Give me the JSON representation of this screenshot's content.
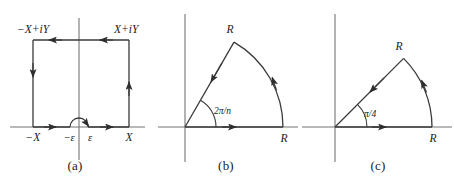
{
  "figure": {
    "type": "contour-integration-diagrams",
    "panel_count": 3,
    "stroke_color": "#3a3a3a",
    "axis_color": "#6f6f6f",
    "text_color": "#1a1a1a",
    "background": "#ffffff"
  },
  "panels": [
    {
      "id": "a",
      "caption": "(a)",
      "shape": "indented-rectangle-contour",
      "labels": {
        "top_left": "−X+iY",
        "top_right": "X+iY",
        "axis_left": "−X",
        "axis_minus_eps": "−ε",
        "axis_plus_eps": "ε",
        "axis_right": "X"
      },
      "arrows": [
        {
          "name": "bottom-left-segment",
          "direction": "right"
        },
        {
          "name": "bottom-right-segment",
          "direction": "right"
        },
        {
          "name": "right-side",
          "direction": "up"
        },
        {
          "name": "top-right-segment",
          "direction": "left"
        },
        {
          "name": "top-left-segment",
          "direction": "left"
        },
        {
          "name": "left-side",
          "direction": "down"
        },
        {
          "name": "small-semicircle-at-origin",
          "direction": "counterclockwise-over-origin"
        }
      ]
    },
    {
      "id": "b",
      "caption": "(b)",
      "shape": "circular-sector-contour",
      "labels": {
        "angle": "2π/n",
        "radius_on_ray": "R",
        "radius_on_axis": "R"
      },
      "angle_value": "2π/n",
      "arrows": [
        {
          "name": "along-real-axis",
          "direction": "right"
        },
        {
          "name": "along-arc",
          "direction": "counterclockwise"
        },
        {
          "name": "along-slanted-ray",
          "direction": "toward-origin"
        }
      ]
    },
    {
      "id": "c",
      "caption": "(c)",
      "shape": "circular-sector-contour",
      "labels": {
        "angle": "π/4",
        "radius_on_ray": "R",
        "radius_on_axis": "R"
      },
      "angle_value": "π/4",
      "arrows": [
        {
          "name": "along-real-axis",
          "direction": "right"
        },
        {
          "name": "along-arc",
          "direction": "counterclockwise"
        },
        {
          "name": "along-slanted-ray",
          "direction": "toward-origin"
        }
      ]
    }
  ]
}
